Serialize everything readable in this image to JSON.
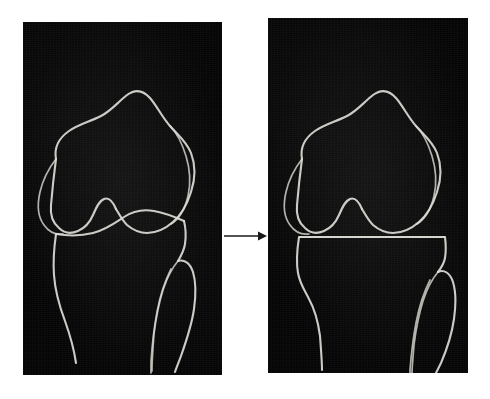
{
  "figure": {
    "title": "Knee joint before and after tibial resection",
    "background_color": "#ffffff",
    "width": 490,
    "height": 399
  },
  "panels": [
    {
      "id": "left",
      "label": "Pre-operative knee radiograph",
      "caption": "Native knee with intact tibial plateau",
      "background_color": "#050505",
      "line_color": "#dcdcd6",
      "structures": [
        {
          "name": "femur",
          "label": "Distal femur with medial and lateral condyles"
        },
        {
          "name": "intercondylar-notch",
          "label": "Intercondylar notch"
        },
        {
          "name": "posterior-condyle-medial",
          "label": "Medial posterior condyle overlap"
        },
        {
          "name": "posterior-condyle-lateral",
          "label": "Lateral posterior condyle overlap"
        },
        {
          "name": "tibia",
          "label": "Proximal tibia with native curved plateau"
        },
        {
          "name": "tibial-plateau",
          "label": "Native contoured tibial plateau",
          "shape": "curved"
        },
        {
          "name": "fibula",
          "label": "Proximal fibula"
        }
      ]
    },
    {
      "id": "right",
      "label": "Post-resection knee radiograph",
      "caption": "Knee after flat proximal tibial cut",
      "background_color": "#050505",
      "line_color": "#dcdcd6",
      "structures": [
        {
          "name": "femur",
          "label": "Distal femur with medial and lateral condyles"
        },
        {
          "name": "intercondylar-notch",
          "label": "Intercondylar notch"
        },
        {
          "name": "posterior-condyle-medial",
          "label": "Medial posterior condyle overlap"
        },
        {
          "name": "posterior-condyle-lateral",
          "label": "Lateral posterior condyle overlap"
        },
        {
          "name": "tibia",
          "label": "Proximal tibia after resection"
        },
        {
          "name": "tibial-resection-line",
          "label": "Flat horizontal tibial resection cut",
          "shape": "straight"
        },
        {
          "name": "fibula",
          "label": "Proximal fibula"
        }
      ]
    }
  ],
  "arrow": {
    "name": "transition-arrow",
    "direction": "right",
    "label": "transforms into",
    "color": "#1a1a1a"
  }
}
